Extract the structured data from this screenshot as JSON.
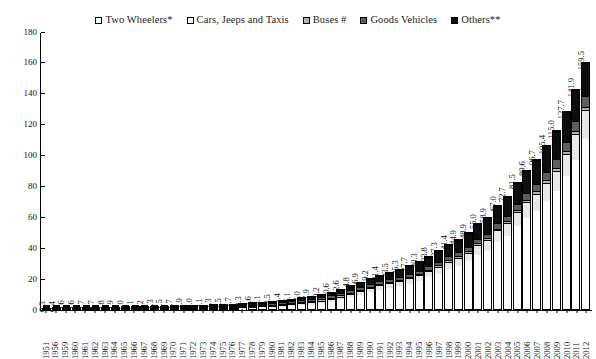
{
  "chart_data": {
    "type": "bar",
    "subtype": "stacked-bar",
    "title": "",
    "subtitle": "",
    "xlabel": "",
    "ylabel": "",
    "ylim": [
      0,
      180
    ],
    "yticks": [
      0,
      20,
      40,
      60,
      80,
      100,
      120,
      140,
      160,
      180
    ],
    "ytick_labels": [
      "0",
      "20",
      "40",
      "60",
      "80",
      "100",
      "120",
      "140",
      "160",
      "180"
    ],
    "grid": false,
    "legend_position": "top-center",
    "legend": [
      {
        "label": "Two Wheelers*",
        "color": "#ffffff",
        "key": "two_wheelers"
      },
      {
        "label": "Cars, Jeeps and Taxis",
        "color": "#e8e8e8",
        "key": "cars_jeeps_taxis"
      },
      {
        "label": "Buses #",
        "color": "#b3b3b3",
        "key": "buses"
      },
      {
        "label": "Goods Vehicles",
        "color": "#5e5e5e",
        "key": "goods_vehicles"
      },
      {
        "label": "Others**",
        "color": "#0d0d0d",
        "key": "others"
      }
    ],
    "categories": [
      "1951",
      "1956",
      "1959",
      "1960",
      "1961",
      "1962",
      "1963",
      "1964",
      "1965",
      "1966",
      "1967",
      "1968",
      "1969",
      "1970",
      "1971",
      "1972",
      "1973",
      "1974",
      "1975",
      "1976",
      "1977",
      "1978",
      "1979",
      "1980",
      "1981",
      "1982",
      "1983",
      "1984",
      "1985",
      "1986",
      "1987",
      "1988",
      "1989",
      "1990",
      "1991",
      "1992",
      "1993",
      "1994",
      "1995",
      "1996",
      "1997",
      "1998",
      "1999",
      "2000",
      "2001",
      "2002",
      "2003",
      "2004",
      "2005",
      "2006",
      "2007",
      "2008",
      "2009",
      "2010",
      "2011",
      "2012"
    ],
    "totals": [
      0.3,
      0.4,
      0.6,
      0.6,
      0.7,
      0.7,
      0.8,
      0.9,
      1.0,
      1.1,
      1.2,
      1.3,
      1.5,
      1.7,
      1.9,
      2.0,
      2.1,
      2.3,
      2.5,
      2.7,
      3.3,
      3.6,
      4.1,
      4.5,
      5.4,
      6.1,
      7.0,
      7.9,
      9.2,
      10.6,
      12.6,
      14.8,
      16.9,
      19.2,
      21.4,
      23.5,
      25.3,
      27.7,
      30.3,
      33.8,
      37.3,
      41.4,
      44.9,
      48.9,
      55.0,
      58.9,
      67.0,
      72.7,
      81.5,
      89.6,
      96.7,
      105.4,
      115.0,
      127.7,
      141.9,
      159.5
    ],
    "data_labels": [
      "0.3",
      "0.4",
      "0.6",
      "0.6",
      "0.7",
      "0.7",
      "0.8",
      "0.9",
      "1.0",
      "1.1",
      "1.2",
      "1.3",
      "1.5",
      "1.7",
      "1.9",
      "2.0",
      "2.1",
      "2.3",
      "2.5",
      "2.7",
      "3.3",
      "3.6",
      "4.1",
      "4.5",
      "5.4",
      "6.1",
      "7.0",
      "7.9",
      "9.2",
      "10.6",
      "12.6",
      "14.8",
      "16.9",
      "19.2",
      "21.4",
      "23.5",
      "25.3",
      "27.7",
      "30.3",
      "33.8",
      "37.3",
      "41.4",
      "44.9",
      "48.9",
      "55.0",
      "58.9",
      "67.0",
      "72.7",
      "81.5",
      "89.6",
      "96.7",
      "105.4",
      "115.0",
      "127.7",
      "141.9",
      "159.5"
    ],
    "series": [
      {
        "name": "Two Wheelers*",
        "color": "#ffffff",
        "values": [
          0.03,
          0.04,
          0.09,
          0.1,
          0.12,
          0.13,
          0.16,
          0.19,
          0.23,
          0.26,
          0.3,
          0.34,
          0.42,
          0.5,
          0.58,
          0.64,
          0.7,
          0.8,
          0.9,
          1.0,
          1.35,
          1.55,
          1.9,
          2.2,
          2.8,
          3.3,
          4.0,
          4.7,
          5.7,
          6.8,
          8.4,
          10.2,
          11.9,
          13.9,
          15.7,
          17.5,
          19.1,
          21.1,
          23.3,
          26.3,
          29.3,
          32.8,
          35.9,
          38.6,
          43.8,
          47.4,
          54.3,
          58.8,
          66.0,
          72.7,
          78.6,
          86.0,
          94.3,
          105.5,
          118.0,
          134.5
        ]
      },
      {
        "name": "Cars, Jeeps and Taxis",
        "color": "#e8e8e8",
        "values": [
          0.16,
          0.2,
          0.25,
          0.26,
          0.28,
          0.29,
          0.31,
          0.33,
          0.35,
          0.37,
          0.39,
          0.41,
          0.45,
          0.48,
          0.53,
          0.55,
          0.57,
          0.6,
          0.64,
          0.67,
          0.77,
          0.8,
          0.87,
          0.91,
          1.04,
          1.16,
          1.27,
          1.4,
          1.56,
          1.74,
          1.99,
          2.23,
          2.46,
          2.71,
          2.95,
          3.19,
          3.42,
          3.68,
          4.0,
          4.4,
          4.8,
          5.3,
          5.7,
          6.14,
          7.06,
          7.61,
          8.6,
          9.45,
          10.32,
          11.53,
          12.65,
          13.95,
          15.3,
          17.11,
          19.23,
          21.56
        ]
      },
      {
        "name": "Buses #",
        "color": "#b3b3b3",
        "values": [
          0.034,
          0.047,
          0.056,
          0.057,
          0.062,
          0.063,
          0.069,
          0.073,
          0.074,
          0.077,
          0.08,
          0.083,
          0.088,
          0.094,
          0.099,
          0.101,
          0.106,
          0.114,
          0.115,
          0.117,
          0.128,
          0.134,
          0.144,
          0.153,
          0.162,
          0.173,
          0.194,
          0.214,
          0.227,
          0.254,
          0.283,
          0.303,
          0.319,
          0.331,
          0.331,
          0.358,
          0.372,
          0.401,
          0.449,
          0.449,
          0.484,
          0.538,
          0.54,
          0.562,
          0.634,
          0.635,
          0.721,
          0.768,
          0.892,
          1.018,
          1.35,
          1.427,
          1.486,
          1.676,
          1.604,
          1.677
        ]
      },
      {
        "name": "Goods Vehicles",
        "color": "#5e5e5e",
        "values": [
          0.082,
          0.119,
          0.168,
          0.168,
          0.171,
          0.175,
          0.18,
          0.19,
          0.21,
          0.236,
          0.258,
          0.276,
          0.3,
          0.343,
          0.378,
          0.399,
          0.425,
          0.452,
          0.484,
          0.516,
          0.583,
          0.637,
          0.715,
          0.77,
          0.876,
          0.96,
          1.025,
          1.113,
          1.217,
          1.336,
          1.465,
          1.593,
          1.734,
          1.356,
          1.356,
          1.514,
          1.603,
          1.691,
          1.787,
          2.031,
          2.343,
          2.536,
          2.554,
          2.715,
          2.948,
          2.974,
          3.492,
          3.749,
          4.031,
          4.436,
          5.119,
          5.601,
          6.041,
          6.432,
          7.064,
          7.65
        ]
      },
      {
        "name": "Others**",
        "color": "#0d0d0d",
        "values": [
          0.003,
          0.01,
          0.03,
          0.03,
          0.04,
          0.04,
          0.05,
          0.06,
          0.09,
          0.12,
          0.15,
          0.18,
          0.23,
          0.27,
          0.3,
          0.32,
          0.33,
          0.35,
          0.37,
          0.4,
          0.49,
          0.54,
          0.6,
          0.7,
          0.9,
          1.0,
          1.1,
          1.2,
          1.4,
          1.7,
          2.0,
          2.3,
          2.6,
          3.0,
          3.7,
          4.4,
          5.0,
          5.6,
          6.2,
          6.9,
          7.7,
          8.5,
          9.3,
          10.0,
          11.1,
          12.0,
          13.5,
          14.5,
          15.8,
          17.4,
          18.5,
          20.0,
          21.4,
          22.9,
          24.1,
          25.8
        ]
      }
    ]
  }
}
